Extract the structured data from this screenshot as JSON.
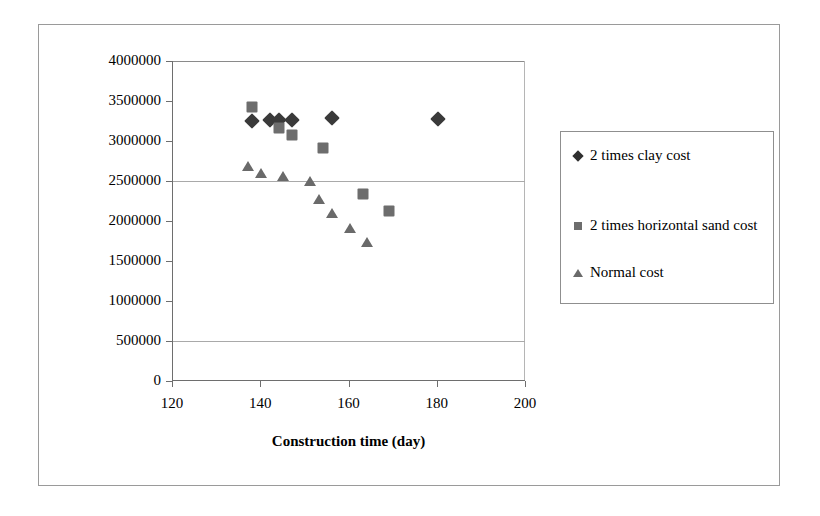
{
  "chart_data": {
    "type": "scatter",
    "title": "",
    "xlabel": "Construction time (day)",
    "ylabel": "Construction cost (€)",
    "xlim": [
      120,
      200
    ],
    "ylim": [
      0,
      4000000
    ],
    "x_ticks": [
      120,
      140,
      160,
      180,
      200
    ],
    "x_tick_labels": [
      "120",
      "140",
      "160",
      "180",
      "200"
    ],
    "y_ticks": [
      0,
      500000,
      1000000,
      1500000,
      2000000,
      2500000,
      3000000,
      3500000,
      4000000
    ],
    "y_tick_labels": [
      "0",
      "500000",
      "1000000",
      "1500000",
      "2000000",
      "2500000",
      "3000000",
      "3500000",
      "4000000"
    ],
    "grid": "horizontal-partial",
    "gridlines_y": [
      500000,
      2500000
    ],
    "legend_position": "right-outside",
    "series": [
      {
        "name": "2 times clay cost",
        "marker": "diamond",
        "color": "#3a3a3a",
        "points": [
          {
            "x": 138,
            "y": 3250000
          },
          {
            "x": 142,
            "y": 3260000
          },
          {
            "x": 144,
            "y": 3260000
          },
          {
            "x": 147,
            "y": 3260000
          },
          {
            "x": 156,
            "y": 3290000
          },
          {
            "x": 180,
            "y": 3270000
          }
        ]
      },
      {
        "name": "2 times horizontal sand cost",
        "marker": "square",
        "color": "#6d6d6d",
        "points": [
          {
            "x": 138,
            "y": 3420000
          },
          {
            "x": 144,
            "y": 3160000
          },
          {
            "x": 147,
            "y": 3070000
          },
          {
            "x": 154,
            "y": 2910000
          },
          {
            "x": 163,
            "y": 2340000
          },
          {
            "x": 169,
            "y": 2120000
          }
        ]
      },
      {
        "name": "Normal cost",
        "marker": "triangle",
        "color": "#6a6a6a",
        "points": [
          {
            "x": 137,
            "y": 2690000
          },
          {
            "x": 140,
            "y": 2600000
          },
          {
            "x": 145,
            "y": 2560000
          },
          {
            "x": 151,
            "y": 2500000
          },
          {
            "x": 153,
            "y": 2280000
          },
          {
            "x": 156,
            "y": 2100000
          },
          {
            "x": 160,
            "y": 1910000
          },
          {
            "x": 164,
            "y": 1740000
          }
        ]
      }
    ]
  },
  "legend": {
    "entries": [
      {
        "label": "2 times clay cost",
        "marker": "diamond"
      },
      {
        "label": "2 times horizontal sand cost",
        "marker": "square"
      },
      {
        "label": "Normal cost",
        "marker": "triangle"
      }
    ]
  }
}
